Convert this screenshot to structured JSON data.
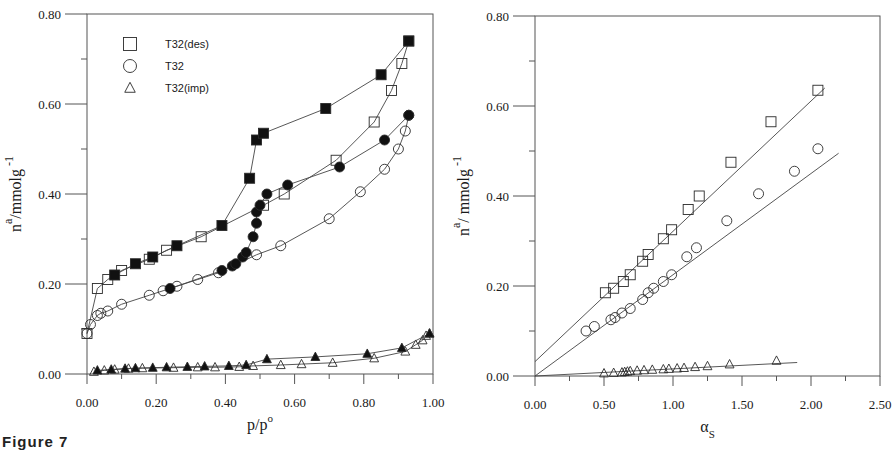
{
  "caption": "Figure 7",
  "chart_data": [
    {
      "type": "scatter",
      "panel": "left",
      "title": "",
      "xlabel": "p/p",
      "xlabel_sup": "o",
      "ylabel": "n",
      "ylabel_sup": "a",
      "ylabel_unit": "/mmolg",
      "ylabel_unit_sup": "-1",
      "xlim": [
        0,
        1.0
      ],
      "ylim": [
        0,
        0.8
      ],
      "xticks": [
        "0.00",
        "0.20",
        "0.40",
        "0.60",
        "0.80",
        "1.00"
      ],
      "yticks": [
        "0.00",
        "0.20",
        "0.40",
        "0.60",
        "0.80"
      ],
      "grid": false,
      "legend_position": "top-left",
      "legend": [
        {
          "marker": "square",
          "label": "T32(des)"
        },
        {
          "marker": "circle",
          "label": "T32"
        },
        {
          "marker": "triangle",
          "label": "T32(imp)"
        }
      ],
      "series": [
        {
          "name": "T32(des) adsorption",
          "marker": "square",
          "filled": false,
          "connected": true,
          "x": [
            0.0,
            0.03,
            0.06,
            0.1,
            0.18,
            0.23,
            0.33,
            0.51,
            0.57,
            0.72,
            0.83,
            0.88,
            0.91,
            0.93
          ],
          "y": [
            0.09,
            0.19,
            0.21,
            0.23,
            0.255,
            0.275,
            0.305,
            0.375,
            0.4,
            0.475,
            0.56,
            0.63,
            0.69,
            0.74
          ]
        },
        {
          "name": "T32(des) desorption",
          "marker": "square",
          "filled": true,
          "connected": true,
          "x": [
            0.08,
            0.14,
            0.19,
            0.26,
            0.39,
            0.47,
            0.49,
            0.51,
            0.69,
            0.85,
            0.93
          ],
          "y": [
            0.22,
            0.245,
            0.26,
            0.285,
            0.33,
            0.435,
            0.52,
            0.535,
            0.59,
            0.665,
            0.74
          ]
        },
        {
          "name": "T32 adsorption",
          "marker": "circle",
          "filled": false,
          "connected": true,
          "x": [
            0.0,
            0.01,
            0.03,
            0.04,
            0.06,
            0.1,
            0.18,
            0.22,
            0.26,
            0.32,
            0.38,
            0.49,
            0.56,
            0.7,
            0.79,
            0.86,
            0.9,
            0.92,
            0.93
          ],
          "y": [
            0.09,
            0.11,
            0.13,
            0.135,
            0.14,
            0.155,
            0.175,
            0.185,
            0.195,
            0.21,
            0.225,
            0.265,
            0.285,
            0.345,
            0.405,
            0.455,
            0.5,
            0.54,
            0.575
          ]
        },
        {
          "name": "T32 desorption",
          "marker": "circle",
          "filled": true,
          "connected": true,
          "x": [
            0.24,
            0.39,
            0.42,
            0.43,
            0.45,
            0.46,
            0.48,
            0.49,
            0.49,
            0.5,
            0.52,
            0.58,
            0.73,
            0.86,
            0.93
          ],
          "y": [
            0.19,
            0.23,
            0.24,
            0.245,
            0.26,
            0.27,
            0.305,
            0.335,
            0.36,
            0.375,
            0.4,
            0.42,
            0.46,
            0.52,
            0.575
          ]
        },
        {
          "name": "T32(imp) adsorption",
          "marker": "triangle",
          "filled": false,
          "connected": true,
          "x": [
            0.02,
            0.05,
            0.08,
            0.12,
            0.16,
            0.25,
            0.32,
            0.37,
            0.44,
            0.48,
            0.56,
            0.62,
            0.71,
            0.83,
            0.92,
            0.95,
            0.97,
            0.98,
            0.99
          ],
          "y": [
            0.005,
            0.008,
            0.01,
            0.012,
            0.013,
            0.014,
            0.015,
            0.015,
            0.016,
            0.018,
            0.02,
            0.022,
            0.025,
            0.035,
            0.05,
            0.065,
            0.075,
            0.085,
            0.09
          ]
        },
        {
          "name": "T32(imp) desorption",
          "marker": "triangle",
          "filled": true,
          "connected": true,
          "x": [
            0.03,
            0.07,
            0.11,
            0.14,
            0.19,
            0.23,
            0.29,
            0.34,
            0.41,
            0.46,
            0.52,
            0.66,
            0.81,
            0.91,
            0.99
          ],
          "y": [
            0.008,
            0.01,
            0.012,
            0.013,
            0.014,
            0.015,
            0.016,
            0.017,
            0.018,
            0.02,
            0.033,
            0.038,
            0.045,
            0.058,
            0.09
          ]
        }
      ]
    },
    {
      "type": "scatter",
      "panel": "right",
      "title": "",
      "xlabel": "α",
      "xlabel_sub": "S",
      "ylabel": "n",
      "ylabel_sup": "a",
      "ylabel_unit": "/ mmolg",
      "ylabel_unit_sup": "-1",
      "xlim": [
        0,
        2.5
      ],
      "ylim": [
        0,
        0.8
      ],
      "xticks": [
        "0.00",
        "0.50",
        "1.00",
        "1.50",
        "2.00",
        "2.50"
      ],
      "yticks": [
        "0.00",
        "0.20",
        "0.40",
        "0.60",
        "0.80"
      ],
      "grid": false,
      "series": [
        {
          "name": "T32(des)",
          "marker": "square",
          "filled": false,
          "connected": false,
          "x": [
            0.51,
            0.57,
            0.64,
            0.69,
            0.78,
            0.82,
            0.93,
            0.99,
            1.11,
            1.19,
            1.42,
            1.71,
            2.05
          ],
          "y": [
            0.185,
            0.195,
            0.21,
            0.225,
            0.255,
            0.27,
            0.305,
            0.325,
            0.37,
            0.4,
            0.475,
            0.565,
            0.635
          ]
        },
        {
          "name": "T32",
          "marker": "circle",
          "filled": false,
          "connected": false,
          "x": [
            0.37,
            0.43,
            0.55,
            0.58,
            0.63,
            0.69,
            0.78,
            0.82,
            0.86,
            0.93,
            0.99,
            1.1,
            1.17,
            1.39,
            1.62,
            1.88,
            2.05
          ],
          "y": [
            0.1,
            0.11,
            0.125,
            0.13,
            0.14,
            0.15,
            0.17,
            0.185,
            0.195,
            0.21,
            0.225,
            0.265,
            0.285,
            0.345,
            0.405,
            0.455,
            0.505
          ]
        },
        {
          "name": "T32(imp)",
          "marker": "triangle",
          "filled": false,
          "connected": false,
          "x": [
            0.5,
            0.57,
            0.63,
            0.65,
            0.67,
            0.69,
            0.74,
            0.79,
            0.85,
            0.93,
            0.97,
            1.03,
            1.08,
            1.16,
            1.25,
            1.41,
            1.75
          ],
          "y": [
            0.006,
            0.007,
            0.008,
            0.009,
            0.01,
            0.011,
            0.012,
            0.013,
            0.014,
            0.015,
            0.016,
            0.017,
            0.018,
            0.02,
            0.022,
            0.026,
            0.034
          ]
        }
      ],
      "fit_lines": [
        {
          "name": "T32(des) fit",
          "x": [
            0.0,
            2.1
          ],
          "y": [
            0.032,
            0.64
          ]
        },
        {
          "name": "T32 fit",
          "x": [
            0.0,
            2.2
          ],
          "y": [
            0.0,
            0.495
          ]
        },
        {
          "name": "T32(imp) fit",
          "x": [
            0.0,
            1.9
          ],
          "y": [
            0.0,
            0.03
          ]
        }
      ]
    }
  ]
}
